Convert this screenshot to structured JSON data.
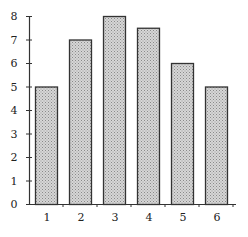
{
  "chart_data": {
    "type": "bar",
    "title": "",
    "xlabel": "",
    "ylabel": "",
    "categories": [
      "1",
      "2",
      "3",
      "4",
      "5",
      "6"
    ],
    "values": [
      5,
      7,
      8,
      7.5,
      6,
      5
    ],
    "ylim": [
      0,
      8
    ],
    "yticks": [
      "0",
      "1",
      "2",
      "3",
      "4",
      "5",
      "6",
      "7",
      "8"
    ],
    "grid": false,
    "legend": null,
    "bar_fill": "#c8c8c8",
    "bar_pattern": "stippled",
    "bar_edge": "#333333"
  }
}
